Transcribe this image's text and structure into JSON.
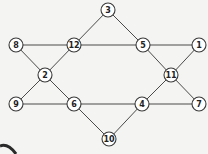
{
  "diagram": {
    "type": "undirected-graph",
    "node_radius": 7,
    "colors": {
      "background": "#f4f4f2",
      "edge": "#4a4a4a",
      "node_fill": "#ffffff",
      "node_stroke": "#3a3a3a",
      "label": "#222222"
    },
    "nodes": [
      {
        "id": "3",
        "label": "3",
        "x": 108,
        "y": 10
      },
      {
        "id": "8",
        "label": "8",
        "x": 16,
        "y": 45
      },
      {
        "id": "12",
        "label": "12",
        "x": 74,
        "y": 45
      },
      {
        "id": "5",
        "label": "5",
        "x": 143,
        "y": 45
      },
      {
        "id": "1",
        "label": "1",
        "x": 199,
        "y": 45
      },
      {
        "id": "2",
        "label": "2",
        "x": 45,
        "y": 75
      },
      {
        "id": "11",
        "label": "11",
        "x": 171,
        "y": 75
      },
      {
        "id": "9",
        "label": "9",
        "x": 16,
        "y": 104
      },
      {
        "id": "6",
        "label": "6",
        "x": 74,
        "y": 104
      },
      {
        "id": "4",
        "label": "4",
        "x": 142,
        "y": 104
      },
      {
        "id": "7",
        "label": "7",
        "x": 199,
        "y": 104
      },
      {
        "id": "10",
        "label": "10",
        "x": 109,
        "y": 139
      }
    ],
    "edges": [
      [
        "3",
        "12"
      ],
      [
        "3",
        "5"
      ],
      [
        "8",
        "12"
      ],
      [
        "12",
        "5"
      ],
      [
        "5",
        "1"
      ],
      [
        "8",
        "2"
      ],
      [
        "12",
        "2"
      ],
      [
        "5",
        "11"
      ],
      [
        "1",
        "11"
      ],
      [
        "2",
        "9"
      ],
      [
        "2",
        "6"
      ],
      [
        "11",
        "4"
      ],
      [
        "11",
        "7"
      ],
      [
        "9",
        "6"
      ],
      [
        "6",
        "4"
      ],
      [
        "4",
        "7"
      ],
      [
        "6",
        "10"
      ],
      [
        "10",
        "4"
      ]
    ]
  }
}
